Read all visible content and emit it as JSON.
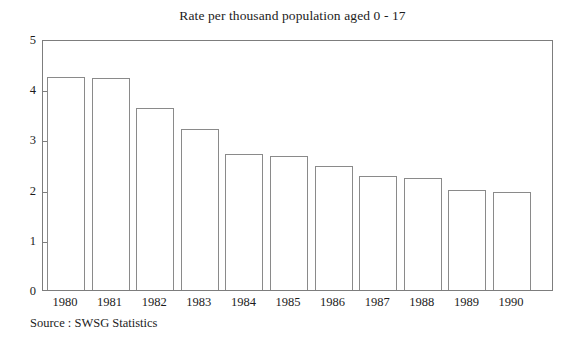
{
  "chart_data": {
    "type": "bar",
    "title": "Rate per thousand population aged 0 - 17",
    "xlabel": "",
    "ylabel": "",
    "ylim": [
      0,
      5
    ],
    "yticks": [
      "0",
      "1",
      "2",
      "3",
      "4",
      "5"
    ],
    "grid": false,
    "legend": null,
    "categories": [
      "1980",
      "1981",
      "1982",
      "1983",
      "1984",
      "1985",
      "1986",
      "1987",
      "1988",
      "1989",
      "1990"
    ],
    "values": [
      4.25,
      4.22,
      3.62,
      3.21,
      2.7,
      2.67,
      2.47,
      2.28,
      2.23,
      2.0,
      1.95
    ],
    "source_note": "Source : SWSG Statistics",
    "bar_fill": "#ffffff",
    "bar_stroke": "#8a8a8a",
    "axis_color": "#7d7d7d",
    "text_color": "#1c1c1c"
  }
}
